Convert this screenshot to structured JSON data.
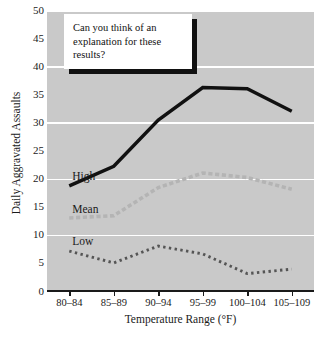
{
  "chart_data": {
    "type": "line",
    "title": "",
    "xlabel": "Temperature Range (°F)",
    "ylabel": "Daily Aggravated Assaults",
    "categories": [
      "80–84",
      "85–89",
      "90–94",
      "95–99",
      "100–104",
      "105–109"
    ],
    "ylim": [
      0,
      50
    ],
    "yticks": [
      0,
      5,
      10,
      15,
      20,
      25,
      30,
      35,
      40,
      45,
      50
    ],
    "gridlines_at": [
      0,
      10,
      20,
      30,
      40,
      50
    ],
    "grid": true,
    "legend_position": "inline-left",
    "series": [
      {
        "name": "High",
        "style": "solid",
        "color": "#111111",
        "values": [
          18.7,
          22.2,
          30.4,
          36.2,
          36.0,
          32.0
        ]
      },
      {
        "name": "Mean",
        "style": "dashed",
        "color": "#b4b4b4",
        "values": [
          13.0,
          13.4,
          18.4,
          21.0,
          20.2,
          18.1
        ]
      },
      {
        "name": "Low",
        "style": "dotted",
        "color": "#555555",
        "values": [
          7.1,
          5.0,
          8.0,
          6.6,
          3.1,
          3.9
        ]
      }
    ]
  },
  "annotation": {
    "callout_text": "Can you think of an explanation for these results?"
  },
  "colors": {
    "plot_background": "#c9c9c9",
    "gridline": "#ffffff",
    "axis": "#1a1a1a",
    "high_series": "#111111",
    "mean_series": "#b4b4b4",
    "low_series": "#555555",
    "callout_background": "#ffffff",
    "callout_shadow": "#111111"
  }
}
